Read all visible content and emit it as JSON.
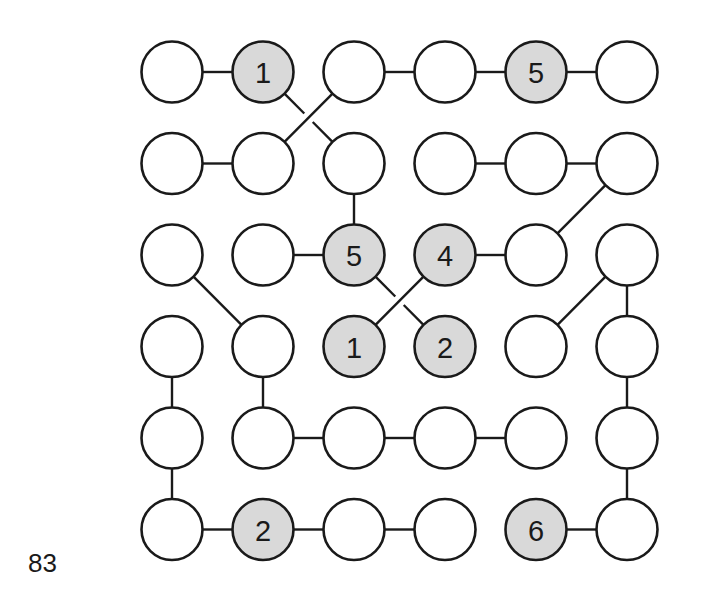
{
  "page_number": "83",
  "puzzle": {
    "rows": 6,
    "cols": 6,
    "layout": {
      "col_centers": [
        172,
        263,
        354,
        445,
        536,
        627
      ],
      "row_centers": [
        72,
        163.5,
        255,
        346.5,
        438,
        529.5
      ],
      "radius": 30.5
    },
    "colors": {
      "clue_fill": "#d9d9d9",
      "empty_fill": "#ffffff",
      "stroke": "#1a1a1a"
    },
    "clues": [
      {
        "row": 0,
        "col": 1,
        "value": "1"
      },
      {
        "row": 0,
        "col": 4,
        "value": "5"
      },
      {
        "row": 2,
        "col": 2,
        "value": "5"
      },
      {
        "row": 2,
        "col": 3,
        "value": "4"
      },
      {
        "row": 3,
        "col": 2,
        "value": "1"
      },
      {
        "row": 3,
        "col": 3,
        "value": "2"
      },
      {
        "row": 5,
        "col": 1,
        "value": "2"
      },
      {
        "row": 5,
        "col": 4,
        "value": "6"
      }
    ],
    "edges": [
      {
        "from": [
          0,
          0
        ],
        "to": [
          0,
          1
        ]
      },
      {
        "from": [
          0,
          2
        ],
        "to": [
          0,
          3
        ]
      },
      {
        "from": [
          0,
          3
        ],
        "to": [
          0,
          4
        ]
      },
      {
        "from": [
          0,
          4
        ],
        "to": [
          0,
          5
        ]
      },
      {
        "from": [
          0,
          1
        ],
        "to": [
          1,
          2
        ],
        "under": true
      },
      {
        "from": [
          0,
          2
        ],
        "to": [
          1,
          1
        ]
      },
      {
        "from": [
          1,
          0
        ],
        "to": [
          1,
          1
        ]
      },
      {
        "from": [
          1,
          3
        ],
        "to": [
          1,
          4
        ]
      },
      {
        "from": [
          1,
          4
        ],
        "to": [
          1,
          5
        ]
      },
      {
        "from": [
          1,
          2
        ],
        "to": [
          2,
          2
        ]
      },
      {
        "from": [
          1,
          5
        ],
        "to": [
          2,
          4
        ]
      },
      {
        "from": [
          2,
          1
        ],
        "to": [
          2,
          2
        ]
      },
      {
        "from": [
          2,
          3
        ],
        "to": [
          2,
          4
        ]
      },
      {
        "from": [
          2,
          0
        ],
        "to": [
          3,
          1
        ]
      },
      {
        "from": [
          2,
          2
        ],
        "to": [
          3,
          3
        ],
        "under": true
      },
      {
        "from": [
          2,
          3
        ],
        "to": [
          3,
          2
        ]
      },
      {
        "from": [
          2,
          5
        ],
        "to": [
          3,
          4
        ]
      },
      {
        "from": [
          2,
          5
        ],
        "to": [
          3,
          5
        ]
      },
      {
        "from": [
          3,
          0
        ],
        "to": [
          4,
          0
        ]
      },
      {
        "from": [
          3,
          1
        ],
        "to": [
          4,
          1
        ]
      },
      {
        "from": [
          3,
          5
        ],
        "to": [
          4,
          5
        ]
      },
      {
        "from": [
          4,
          1
        ],
        "to": [
          4,
          2
        ]
      },
      {
        "from": [
          4,
          2
        ],
        "to": [
          4,
          3
        ]
      },
      {
        "from": [
          4,
          3
        ],
        "to": [
          4,
          4
        ]
      },
      {
        "from": [
          4,
          0
        ],
        "to": [
          5,
          0
        ]
      },
      {
        "from": [
          4,
          5
        ],
        "to": [
          5,
          5
        ]
      },
      {
        "from": [
          5,
          0
        ],
        "to": [
          5,
          1
        ]
      },
      {
        "from": [
          5,
          1
        ],
        "to": [
          5,
          2
        ]
      },
      {
        "from": [
          5,
          2
        ],
        "to": [
          5,
          3
        ]
      },
      {
        "from": [
          5,
          4
        ],
        "to": [
          5,
          5
        ]
      }
    ]
  }
}
